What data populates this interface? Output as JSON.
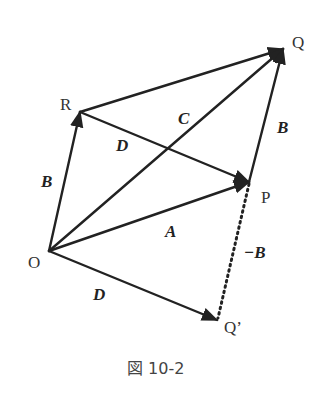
{
  "diagram": {
    "type": "vector-diagram",
    "points": {
      "O": {
        "label": "O",
        "x": 49,
        "y": 251
      },
      "R": {
        "label": "R",
        "x": 80,
        "y": 112
      },
      "Q": {
        "label": "Q",
        "x": 283,
        "y": 49
      },
      "P": {
        "label": "P",
        "x": 249,
        "y": 182
      },
      "Qp": {
        "label": "Q’",
        "x": 217,
        "y": 320
      }
    },
    "vectors": [
      {
        "from": "O",
        "to": "R",
        "label": "B",
        "style": "solid"
      },
      {
        "from": "R",
        "to": "Q",
        "label": "",
        "style": "solid"
      },
      {
        "from": "R",
        "to": "P",
        "label": "D",
        "style": "solid"
      },
      {
        "from": "O",
        "to": "Q",
        "label": "C",
        "style": "solid"
      },
      {
        "from": "O",
        "to": "P",
        "label": "A",
        "style": "solid"
      },
      {
        "from": "P",
        "to": "Q",
        "label": "B",
        "style": "solid"
      },
      {
        "from": "O",
        "to": "Qp",
        "label": "D",
        "style": "solid"
      },
      {
        "from": "P",
        "to": "Qp",
        "label": "−B",
        "style": "dotted"
      }
    ],
    "labels": {
      "B_left": "B",
      "D_mid": "D",
      "C": "C",
      "B_right": "B",
      "A": "A",
      "minus_B": "−B",
      "D_bottom": "D"
    },
    "caption": "図 10-2"
  }
}
